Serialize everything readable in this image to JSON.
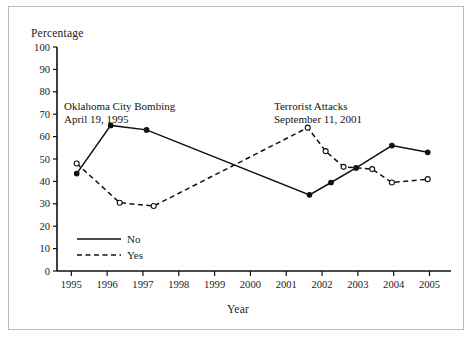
{
  "figure": {
    "border_color": "#b9b9b9",
    "background": "#ffffff"
  },
  "chart_data": {
    "type": "line",
    "title": "",
    "xlabel": "Year",
    "ylabel": "Percentage",
    "x": [
      1995,
      1996,
      1997,
      1998,
      1999,
      2000,
      2001,
      2002,
      2003,
      2004,
      2005
    ],
    "categories": [
      "1995",
      "1996",
      "1997",
      "1998",
      "1999",
      "2000",
      "2001",
      "2002",
      "2003",
      "2004",
      "2005"
    ],
    "xlim": [
      1994.6,
      2005.6
    ],
    "ylim": [
      0,
      100
    ],
    "yticks": [
      0,
      10,
      20,
      30,
      40,
      50,
      60,
      70,
      80,
      90,
      100
    ],
    "ytick_labels": [
      "0",
      "10",
      "20",
      "30",
      "40",
      "50",
      "60",
      "70",
      "80",
      "90",
      "100"
    ],
    "grid": false,
    "legend_position": "inside-lower-left",
    "series": [
      {
        "name": "No",
        "style": "solid",
        "marker": "filled-circle",
        "color": "#111111",
        "points": [
          {
            "x": 1995.15,
            "y": 43.5
          },
          {
            "x": 1996.1,
            "y": 65.0
          },
          {
            "x": 1997.1,
            "y": 63.0
          },
          {
            "x": 2001.65,
            "y": 34.0
          },
          {
            "x": 2002.25,
            "y": 39.5
          },
          {
            "x": 2002.95,
            "y": 46.0
          },
          {
            "x": 2003.95,
            "y": 56.0
          },
          {
            "x": 2004.95,
            "y": 53.0
          }
        ],
        "values": [
          43.5,
          65.0,
          63.0,
          null,
          null,
          null,
          34.0,
          39.5,
          46.0,
          56.0,
          53.0
        ]
      },
      {
        "name": "Yes",
        "style": "dashed",
        "marker": "open-circle",
        "color": "#111111",
        "points": [
          {
            "x": 1995.15,
            "y": 48.0
          },
          {
            "x": 1996.35,
            "y": 30.5
          },
          {
            "x": 1997.3,
            "y": 29.0
          },
          {
            "x": 2001.6,
            "y": 64.0
          },
          {
            "x": 2002.1,
            "y": 53.5
          },
          {
            "x": 2002.6,
            "y": 46.5
          },
          {
            "x": 2003.4,
            "y": 45.5
          },
          {
            "x": 2003.95,
            "y": 39.5
          },
          {
            "x": 2004.95,
            "y": 41.0
          }
        ],
        "values": [
          48.0,
          30.5,
          29.0,
          null,
          null,
          null,
          64.0,
          46.5,
          45.5,
          39.5,
          41.0
        ]
      }
    ],
    "annotations": [
      {
        "id": "okc",
        "line1": "Oklahoma City Bombing",
        "line2": "April 19, 1995"
      },
      {
        "id": "terror",
        "line1": "Terrorist Attacks",
        "line2": "September 11, 2001"
      }
    ],
    "legend": [
      {
        "label": "No",
        "style": "solid"
      },
      {
        "label": "Yes",
        "style": "dashed"
      }
    ]
  }
}
